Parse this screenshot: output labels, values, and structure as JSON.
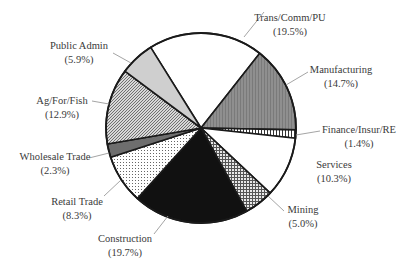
{
  "chart_data": {
    "type": "pie",
    "title": "",
    "center": [
      201,
      128
    ],
    "radius": 95,
    "start_angle_deg": -32,
    "direction": "clockwise",
    "categories": [
      "Trans/Comm/PU",
      "Manufacturing",
      "Finance/Insur/RE",
      "Services",
      "Mining",
      "Construction",
      "Retail Trade",
      "Wholesale Trade",
      "Ag/For/Fish",
      "Public Admin"
    ],
    "values": [
      19.5,
      14.7,
      1.4,
      10.3,
      5.0,
      19.7,
      8.3,
      2.3,
      12.9,
      5.9
    ],
    "slices": [
      {
        "label": "Trans/Comm/PU",
        "pct_label": "(19.5%)",
        "value": 19.5,
        "fill": "white",
        "text_x": 290,
        "text_y": 21,
        "anchor": "middle",
        "leader": [
          [
            244,
            37
          ],
          [
            264,
            12
          ]
        ]
      },
      {
        "label": "Manufacturing",
        "pct_label": "(14.7%)",
        "value": 14.7,
        "fill": "gray",
        "text_x": 341,
        "text_y": 73,
        "anchor": "middle",
        "leader": [
          [
            286,
            85
          ],
          [
            308,
            72
          ]
        ]
      },
      {
        "label": "Finance/Insur/RE",
        "pct_label": "(1.4%)",
        "value": 1.4,
        "fill": "vlines",
        "text_x": 359,
        "text_y": 133,
        "anchor": "middle",
        "leader": [
          [
            296,
            135
          ],
          [
            320,
            131
          ]
        ]
      },
      {
        "label": "Services",
        "pct_label": "(10.3%)",
        "value": 10.3,
        "fill": "white",
        "text_x": 334,
        "text_y": 168,
        "anchor": "middle",
        "leader": null
      },
      {
        "label": "Mining",
        "pct_label": "(5.0%)",
        "value": 5.0,
        "fill": "crosshatch",
        "text_x": 303,
        "text_y": 213,
        "anchor": "middle",
        "leader": [
          [
            268,
            196
          ],
          [
            284,
            211
          ]
        ]
      },
      {
        "label": "Construction",
        "pct_label": "(19.7%)",
        "value": 19.7,
        "fill": "black",
        "text_x": 125,
        "text_y": 242,
        "anchor": "middle",
        "leader": [
          [
            168,
            216
          ],
          [
            154,
            234
          ]
        ]
      },
      {
        "label": "Retail Trade",
        "pct_label": "(8.3%)",
        "value": 8.3,
        "fill": "dots",
        "text_x": 77,
        "text_y": 205,
        "anchor": "middle",
        "leader": [
          [
            121,
            180
          ],
          [
            104,
            196
          ]
        ]
      },
      {
        "label": "Wholesale Trade",
        "pct_label": "(2.3%)",
        "value": 2.3,
        "fill": "darkgray",
        "text_x": 55,
        "text_y": 160,
        "anchor": "middle",
        "leader": [
          [
            109,
            153
          ],
          [
            89,
            158
          ]
        ]
      },
      {
        "label": "Ag/For/Fish",
        "pct_label": "(12.9%)",
        "value": 12.9,
        "fill": "diag",
        "text_x": 62,
        "text_y": 104,
        "anchor": "middle",
        "leader": [
          [
            109,
            104
          ],
          [
            92,
            101
          ]
        ]
      },
      {
        "label": "Public Admin",
        "pct_label": "(5.9%)",
        "value": 5.9,
        "fill": "lightgray",
        "text_x": 79,
        "text_y": 49,
        "anchor": "middle",
        "leader": [
          [
            131,
            63
          ],
          [
            113,
            53
          ]
        ]
      }
    ],
    "legend": null,
    "xlabel": "",
    "ylabel": ""
  }
}
